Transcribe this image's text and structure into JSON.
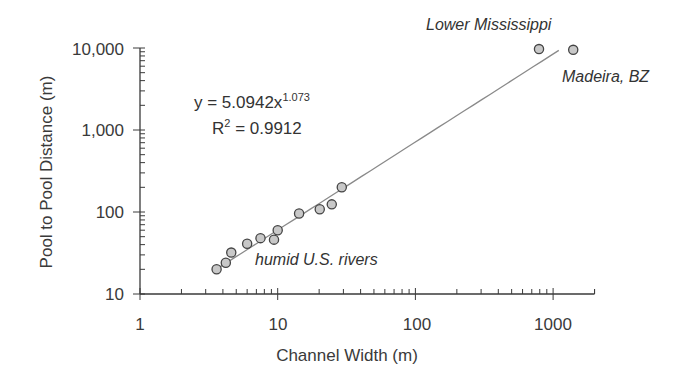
{
  "chart_data": {
    "type": "scatter",
    "title": "",
    "xlabel": "Channel Width (m)",
    "ylabel": "Pool to Pool Distance (m)",
    "xscale": "log",
    "yscale": "log",
    "xlim": [
      1,
      2000
    ],
    "ylim": [
      10,
      10000
    ],
    "x_ticks": [
      "1",
      "10",
      "100",
      "1000"
    ],
    "y_ticks": [
      "10",
      "100",
      "1,000",
      "10,000"
    ],
    "grid": false,
    "legend": null,
    "series": [
      {
        "name": "rivers",
        "marker": "circle",
        "marker_fill": "#c8c8c8",
        "marker_edge": "#444444",
        "points": [
          {
            "x": 3.6,
            "y": 20
          },
          {
            "x": 4.2,
            "y": 24
          },
          {
            "x": 4.6,
            "y": 32
          },
          {
            "x": 6.0,
            "y": 41
          },
          {
            "x": 7.5,
            "y": 48
          },
          {
            "x": 9.4,
            "y": 46
          },
          {
            "x": 10.0,
            "y": 60
          },
          {
            "x": 14.3,
            "y": 96
          },
          {
            "x": 20.2,
            "y": 108
          },
          {
            "x": 24.7,
            "y": 124
          },
          {
            "x": 29.2,
            "y": 200
          },
          {
            "x": 790,
            "y": 9700
          },
          {
            "x": 1400,
            "y": 9500
          }
        ]
      }
    ],
    "trendline": {
      "type": "power",
      "a": 5.0942,
      "b": 1.073,
      "r2": 0.9912,
      "x_range": [
        3.6,
        1100
      ],
      "color": "#8a8a8a"
    },
    "annotations": [
      {
        "text": "y = 5.0942x",
        "sup": "1.073"
      },
      {
        "text": "R",
        "sup": "2",
        "rest": " = 0.9912"
      },
      {
        "text": "Lower Mississippi"
      },
      {
        "text": "Madeira, BZ"
      },
      {
        "text": "humid U.S. rivers"
      }
    ]
  },
  "labels": {
    "x_axis_title": "Channel Width (m)",
    "y_axis_title": "Pool to Pool Distance (m)",
    "x_ticks": [
      "1",
      "10",
      "100",
      "1000"
    ],
    "y_ticks": [
      "10",
      "100",
      "1,000",
      "10,000"
    ],
    "equation_main": "y = 5.0942x",
    "equation_exp": "1.073",
    "r2_prefix": "R",
    "r2_sup": "2",
    "r2_value": " = 0.9912",
    "annot_mississippi": "Lower Mississippi",
    "annot_madeira": "Madeira, BZ",
    "annot_humid": "humid U.S. rivers"
  }
}
